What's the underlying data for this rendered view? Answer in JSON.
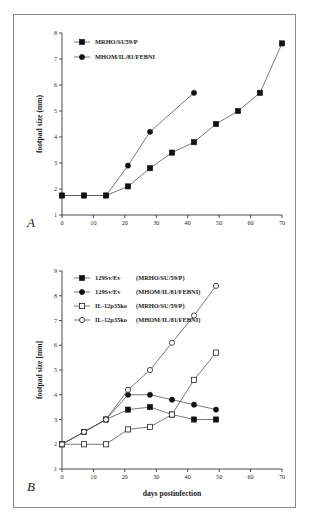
{
  "figure": {
    "panel_a_letter": "A",
    "panel_b_letter": "B"
  },
  "chart_data": [
    {
      "type": "line",
      "panel": "A",
      "title": "",
      "xlabel": "",
      "ylabel": "footpad size (mm)",
      "xlim": [
        0,
        70
      ],
      "ylim": [
        1,
        8
      ],
      "xticks": [
        0,
        10,
        20,
        30,
        40,
        50,
        60,
        70
      ],
      "yticks": [
        1,
        2,
        3,
        4,
        5,
        6,
        7,
        8
      ],
      "grid": false,
      "legend_position": "top-left",
      "series": [
        {
          "name": "MRHO/SU59/P",
          "marker": "filled-square",
          "x": [
            0,
            7,
            14,
            21,
            28,
            35,
            42,
            49,
            56,
            63,
            70
          ],
          "y": [
            1.75,
            1.75,
            1.75,
            2.1,
            2.8,
            3.4,
            3.8,
            4.5,
            5.0,
            5.7,
            7.6
          ]
        },
        {
          "name": "MHOM/IL/81/FEBNI",
          "marker": "filled-circle",
          "x": [
            0,
            7,
            14,
            21,
            28,
            42
          ],
          "y": [
            1.75,
            1.75,
            1.75,
            2.9,
            4.2,
            5.7
          ]
        }
      ]
    },
    {
      "type": "line",
      "panel": "B",
      "title": "",
      "xlabel": "days postinfection",
      "ylabel": "footpad size [mm]",
      "xlim": [
        0,
        70
      ],
      "ylim": [
        1,
        9
      ],
      "xticks": [
        0,
        10,
        20,
        30,
        40,
        50,
        60,
        70
      ],
      "yticks": [
        1,
        2,
        3,
        4,
        5,
        6,
        7,
        8,
        9
      ],
      "grid": false,
      "legend_position": "top-left",
      "series": [
        {
          "name": "129Sv/Ev",
          "strain": "(MRHO/SU/59/P)",
          "marker": "filled-square",
          "x": [
            0,
            7,
            14,
            21,
            28,
            35,
            42,
            49
          ],
          "y": [
            2.0,
            2.5,
            3.0,
            3.4,
            3.5,
            3.2,
            3.0,
            3.0
          ]
        },
        {
          "name": "129Sv/Ev",
          "strain": "(MHOM/IL/81/FEBNI)",
          "marker": "filled-circle",
          "x": [
            0,
            7,
            14,
            21,
            28,
            35,
            42,
            49
          ],
          "y": [
            2.0,
            2.5,
            3.0,
            4.0,
            4.0,
            3.8,
            3.6,
            3.4
          ]
        },
        {
          "name": "IL-12p35ko",
          "strain": "(MRHO/SU/59/P)",
          "marker": "open-square",
          "x": [
            0,
            7,
            14,
            21,
            28,
            35,
            42,
            49
          ],
          "y": [
            2.0,
            2.0,
            2.0,
            2.6,
            2.7,
            3.2,
            4.6,
            5.7
          ]
        },
        {
          "name": "IL-12p35ko",
          "strain": "(MHOM/IL/81/FEBNI)",
          "marker": "open-circle",
          "x": [
            0,
            7,
            14,
            21,
            28,
            35,
            42,
            49
          ],
          "y": [
            2.0,
            2.5,
            3.0,
            4.2,
            5.0,
            6.1,
            7.2,
            8.4
          ]
        }
      ]
    }
  ],
  "panel_a": {
    "ylabel": "footpad size (mm)",
    "yticks": [
      "1",
      "2",
      "3",
      "4",
      "5",
      "6",
      "7",
      "8"
    ],
    "xticks": [
      "0",
      "10",
      "20",
      "30",
      "40",
      "50",
      "60",
      "70"
    ],
    "legend": [
      {
        "label": "MRHO/SU59/P",
        "marker": "filled-square"
      },
      {
        "label": "MHOM/IL/81/FEBNI",
        "marker": "filled-circle"
      }
    ]
  },
  "panel_b": {
    "ylabel": "footpad size [mm]",
    "xlabel": "days postinfection",
    "yticks": [
      "1",
      "2",
      "3",
      "4",
      "5",
      "6",
      "7",
      "8",
      "9"
    ],
    "xticks": [
      "0",
      "10",
      "20",
      "30",
      "40",
      "50",
      "60",
      "70"
    ],
    "legend": [
      {
        "label": "129Sv/Ev",
        "strain": "(MRHO/SU/59/P)",
        "marker": "filled-square"
      },
      {
        "label": "129Sv/Ev",
        "strain": "(MHOM/IL/81/FEBNI)",
        "marker": "filled-circle"
      },
      {
        "label": "IL-12p35ko",
        "strain": "(MRHO/SU/59/P)",
        "marker": "open-square"
      },
      {
        "label": "IL-12p35ko",
        "strain": "(MHOM/IL/81/FEBNI)",
        "marker": "open-circle"
      }
    ]
  }
}
